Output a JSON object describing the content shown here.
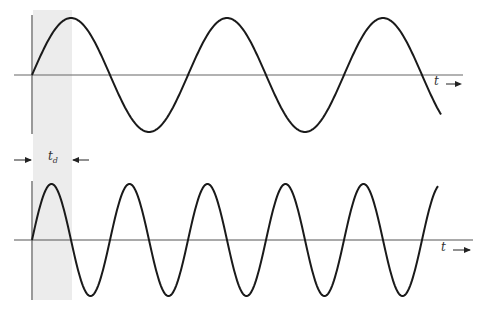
{
  "diagram": {
    "colors": {
      "wave": "#1a1a1a",
      "axis": "#555555",
      "shade": "#ececec"
    },
    "top_wave": {
      "axis_label": "t",
      "periods_shown": 2.7
    },
    "bottom_wave": {
      "axis_label": "t",
      "periods_shown": 5.3
    },
    "delay_marker": {
      "label": "t",
      "subscript": "d"
    }
  }
}
